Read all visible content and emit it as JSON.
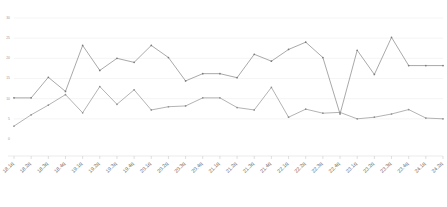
{
  "chart_data": {
    "type": "line",
    "title": "",
    "xlabel": "",
    "ylabel": "",
    "ylim": [
      0,
      30
    ],
    "yticks": [
      0,
      5,
      10,
      15,
      20,
      25,
      30
    ],
    "ytick_labels": [
      "0",
      "5",
      "10",
      "15",
      "20",
      "25",
      "30"
    ],
    "grid": true,
    "legend": "none",
    "categories": [
      "18.1q",
      "18.2q",
      "18.3q",
      "18.4q",
      "19.1q",
      "19.2q",
      "19.3q",
      "19.4q",
      "20.1q",
      "20.2q",
      "20.3q",
      "20.4q",
      "21.1q",
      "21.2q",
      "21.3q",
      "21.4q",
      "22.1q",
      "22.2q",
      "22.3q",
      "22.4q",
      "23.1q",
      "23.2q",
      "23.3q",
      "23.4q",
      "24.1q",
      "24.2q"
    ],
    "series": [
      {
        "name": "series-a",
        "color": "#8c8c8c",
        "values": [
          10.2,
          10.2,
          15.3,
          11.8,
          23.2,
          17.0,
          20.0,
          19.0,
          23.2,
          20.2,
          14.4,
          16.2,
          16.2,
          15.2,
          21.0,
          19.3,
          22.2,
          24.0,
          20.2,
          6.2,
          22.0,
          16.0,
          25.2,
          18.2,
          18.2,
          18.2
        ]
      },
      {
        "name": "series-b",
        "color": "#9a9a9a",
        "values": [
          3.2,
          6.0,
          8.4,
          11.0,
          6.5,
          13.0,
          8.6,
          12.2,
          7.2,
          8.0,
          8.2,
          10.2,
          10.2,
          7.8,
          7.2,
          12.8,
          5.4,
          7.4,
          6.4,
          6.6,
          5.0,
          5.4,
          6.2,
          7.3,
          5.2,
          5.0
        ]
      }
    ]
  },
  "axes": {
    "y_axis_name": "y-axis",
    "x_axis_name": "x-axis"
  }
}
